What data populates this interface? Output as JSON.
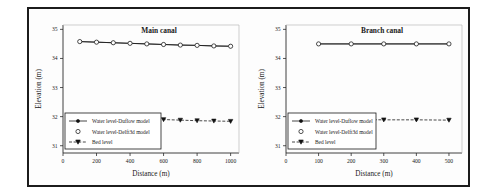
{
  "figure": {
    "background": "#ffffff",
    "frame_color": "#1c1c1c"
  },
  "chart_data": [
    {
      "type": "line",
      "title": "Main canal",
      "xlabel": "Distance (m)",
      "ylabel": "Elevation (m)",
      "xlim": [
        0,
        1050
      ],
      "ylim": [
        30.75,
        35.15
      ],
      "xticks": [
        0,
        200,
        400,
        600,
        800,
        1000
      ],
      "xtick_labels": [
        "0",
        "200",
        "400",
        "600",
        "800",
        "1000"
      ],
      "yticks": [
        31,
        32,
        33,
        34,
        35
      ],
      "ytick_labels": [
        "31",
        "32",
        "33",
        "34",
        "35"
      ],
      "grid": false,
      "legend_position": "lower left",
      "x": [
        100,
        200,
        300,
        400,
        500,
        600,
        700,
        800,
        900,
        1000
      ],
      "series": [
        {
          "name": "Water level-Duflow model",
          "marker": "filled-circle",
          "linestyle": "solid",
          "color": "#1a1a1a",
          "values": [
            34.58,
            34.56,
            34.54,
            34.52,
            34.5,
            34.48,
            34.46,
            34.45,
            34.43,
            34.42
          ]
        },
        {
          "name": "Water level-Delft3d model",
          "marker": "open-circle",
          "linestyle": "solid",
          "color": "#1a1a1a",
          "values": [
            34.58,
            34.56,
            34.54,
            34.52,
            34.5,
            34.48,
            34.46,
            34.45,
            34.43,
            34.42
          ]
        },
        {
          "name": "Bed level",
          "marker": "filled-triangle-down",
          "linestyle": "dashed",
          "color": "#1a1a1a",
          "values": [
            31.99,
            31.97,
            31.95,
            31.93,
            31.92,
            31.9,
            31.88,
            31.86,
            31.85,
            31.84
          ]
        }
      ]
    },
    {
      "type": "line",
      "title": "Branch canal",
      "xlabel": "Distance (m)",
      "ylabel": "Elevation (m)",
      "xlim": [
        0,
        540
      ],
      "ylim": [
        30.75,
        35.15
      ],
      "xticks": [
        0,
        100,
        200,
        300,
        400,
        500
      ],
      "xtick_labels": [
        "0",
        "100",
        "200",
        "300",
        "400",
        "500"
      ],
      "yticks": [
        31,
        32,
        33,
        34,
        35
      ],
      "ytick_labels": [
        "31",
        "32",
        "33",
        "34",
        "35"
      ],
      "grid": false,
      "legend_position": "lower left",
      "x": [
        100,
        200,
        300,
        400,
        500
      ],
      "series": [
        {
          "name": "Water level-Duflow model",
          "marker": "filled-circle",
          "linestyle": "solid",
          "color": "#1a1a1a",
          "values": [
            34.5,
            34.5,
            34.5,
            34.5,
            34.5
          ]
        },
        {
          "name": "Water level-Delft3d model",
          "marker": "open-circle",
          "linestyle": "solid",
          "color": "#1a1a1a",
          "values": [
            34.5,
            34.5,
            34.5,
            34.5,
            34.5
          ]
        },
        {
          "name": "Bed level",
          "marker": "filled-triangle-down",
          "linestyle": "dashed",
          "color": "#1a1a1a",
          "values": [
            31.9,
            31.9,
            31.89,
            31.89,
            31.88
          ]
        }
      ]
    }
  ]
}
